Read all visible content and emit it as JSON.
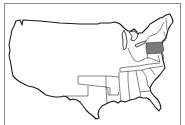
{
  "map": {
    "subject": "United States outline map",
    "highlighted_region": "Pennsylvania",
    "colors": {
      "highlight": "#7a7a7a",
      "land": "#ffffff",
      "outline": "#1a1a1a",
      "frame": "#8a8a8a"
    }
  }
}
